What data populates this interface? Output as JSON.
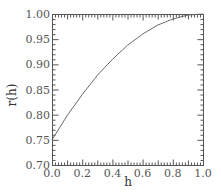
{
  "chart_data": {
    "type": "line",
    "title": "",
    "xlabel": "h",
    "ylabel": "r(h)",
    "xlim": [
      0.0,
      1.0
    ],
    "ylim": [
      0.7,
      1.0
    ],
    "grid": false,
    "legend": null,
    "x_ticks": [
      "0.0",
      "0.2",
      "0.4",
      "0.6",
      "0.8",
      "1.0"
    ],
    "y_ticks": [
      "0.70",
      "0.75",
      "0.80",
      "0.85",
      "0.90",
      "0.95",
      "1.00"
    ],
    "series": [
      {
        "name": "r(h)",
        "color": "#666666",
        "x": [
          0.0,
          0.1,
          0.2,
          0.3,
          0.4,
          0.5,
          0.6,
          0.7,
          0.8,
          0.9,
          1.0
        ],
        "y": [
          0.75,
          0.798,
          0.84,
          0.878,
          0.91,
          0.938,
          0.96,
          0.978,
          0.99,
          0.998,
          1.0
        ]
      }
    ]
  },
  "frame": {
    "left": 52,
    "top": 14,
    "right": 203,
    "bottom": 165
  },
  "colors": {
    "axis": "#555555",
    "line": "#777777"
  }
}
